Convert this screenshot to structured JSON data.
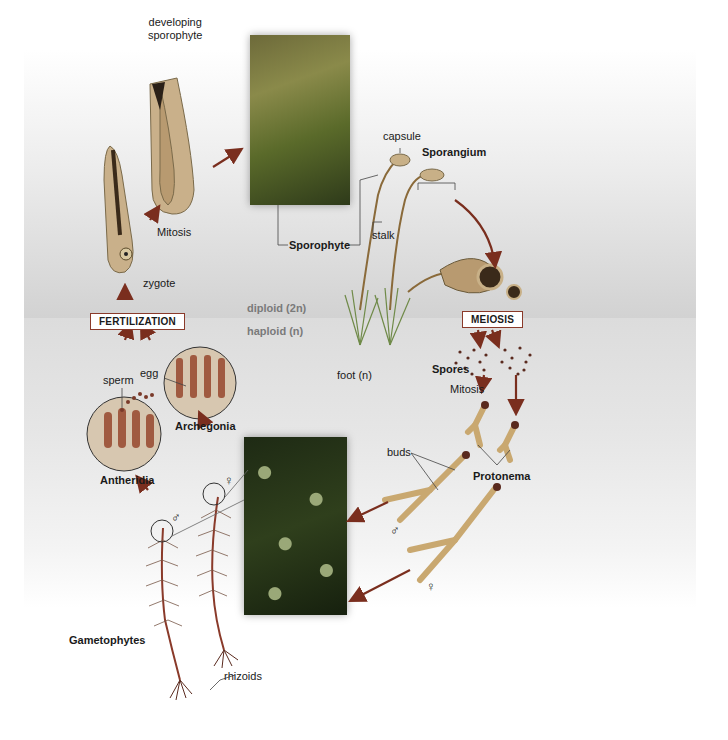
{
  "diagram": {
    "zones": {
      "diploid_label": "diploid (2n)",
      "haploid_label": "haploid (n)"
    },
    "process_boxes": {
      "fertilization": "FERTILIZATION",
      "meiosis": "MEIOSIS"
    },
    "labels": {
      "developing_sporophyte_line1": "developing",
      "developing_sporophyte_line2": "sporophyte",
      "mitosis_upper": "Mitosis",
      "zygote": "zygote",
      "sporophyte": "Sporophyte",
      "capsule": "capsule",
      "sporangium": "Sporangium",
      "stalk": "stalk",
      "foot": "foot (n)",
      "spores": "Spores",
      "mitosis_lower": "Mitosis",
      "buds": "buds",
      "protonema": "Protonema",
      "sperm": "sperm",
      "egg": "egg",
      "archegonia": "Archegonia",
      "antheridia": "Antheridia",
      "gametophytes": "Gametophytes",
      "rhizoids": "rhizoids",
      "male_symbol": "♂",
      "female_symbol": "♀"
    },
    "colors": {
      "arrow": "#7a2e1e",
      "box_border": "#8a3a2a",
      "moss_green": "#5f7a3a",
      "gametophyte_red": "#8a3a2a",
      "capsule_brown": "#a08a6a",
      "diploid_band": "#d2d2d2",
      "haploid_band": "#dcdcdc"
    }
  }
}
